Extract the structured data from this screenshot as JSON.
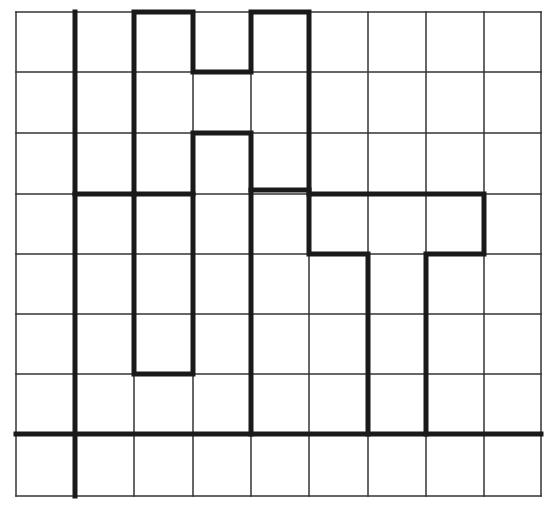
{
  "diagram": {
    "type": "grid-with-thick-outlines",
    "canvas": {
      "width": 558,
      "height": 509
    },
    "grid": {
      "columns": 9,
      "rows": 8,
      "x_lines": [
        16,
        75,
        134,
        193,
        251,
        309,
        368,
        426,
        484,
        541
      ],
      "y_lines": [
        12,
        72,
        133,
        194,
        254,
        314,
        374,
        434,
        496
      ],
      "line_color": "#333333",
      "line_width": 1.5
    },
    "thick_style": {
      "color": "#1a1a1a",
      "width": 5
    },
    "axes": [
      {
        "name": "vertical-axis",
        "x1": 75,
        "y1": 12,
        "x2": 75,
        "y2": 496
      },
      {
        "name": "horizontal-axis",
        "x1": 16,
        "y1": 434,
        "x2": 541,
        "y2": 434
      }
    ],
    "thick_segments": [
      {
        "name": "left-shape-top",
        "points": [
          [
            75,
            194
          ],
          [
            134,
            194
          ]
        ]
      },
      {
        "name": "tall-bar-outline",
        "points": [
          [
            134,
            194
          ],
          [
            134,
            12
          ],
          [
            193,
            12
          ],
          [
            193,
            72
          ],
          [
            251,
            72
          ],
          [
            251,
            12
          ],
          [
            309,
            12
          ],
          [
            309,
            194
          ]
        ]
      },
      {
        "name": "tall-bar-lower",
        "points": [
          [
            134,
            194
          ],
          [
            134,
            374
          ],
          [
            193,
            374
          ],
          [
            193,
            133
          ],
          [
            251,
            133
          ],
          [
            251,
            434
          ]
        ]
      },
      {
        "name": "mid-ledge",
        "points": [
          [
            134,
            194
          ],
          [
            193,
            194
          ]
        ]
      },
      {
        "name": "mid-ledge-right",
        "points": [
          [
            251,
            190
          ],
          [
            309,
            190
          ]
        ]
      },
      {
        "name": "right-shape",
        "points": [
          [
            368,
            434
          ],
          [
            368,
            254
          ],
          [
            309,
            254
          ],
          [
            309,
            194
          ],
          [
            484,
            194
          ],
          [
            484,
            254
          ],
          [
            426,
            254
          ],
          [
            426,
            434
          ]
        ]
      }
    ]
  }
}
